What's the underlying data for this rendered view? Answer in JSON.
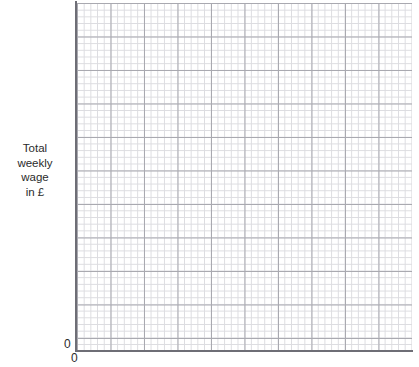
{
  "figure": {
    "type": "blank-graph-paper",
    "background_color": "#ffffff"
  },
  "y_axis": {
    "title_lines": [
      "Total",
      "weekly",
      "wage",
      "in £"
    ],
    "origin_label": "0",
    "line_color": "#6e6e76"
  },
  "x_axis": {
    "origin_label": "0",
    "line_color": "#6e6e76"
  },
  "grid": {
    "minor_color": "#dcdce0",
    "major_color": "#a9a9b0",
    "minor_per_major": 5,
    "major_columns": 10,
    "major_rows": 10
  },
  "chart_data": {
    "type": "line",
    "title": "",
    "subtitle": "",
    "xlabel": "",
    "ylabel": "Total weekly wage in £",
    "xtick_labels": [
      "0"
    ],
    "ytick_labels": [
      "0"
    ],
    "xlim": [
      0,
      50
    ],
    "ylim": [
      0,
      50
    ],
    "grid": true,
    "legend": "none",
    "series": [],
    "x": [],
    "values": [],
    "annotations": [],
    "note": "Empty grid — no plotted data points are drawn in the figure."
  }
}
